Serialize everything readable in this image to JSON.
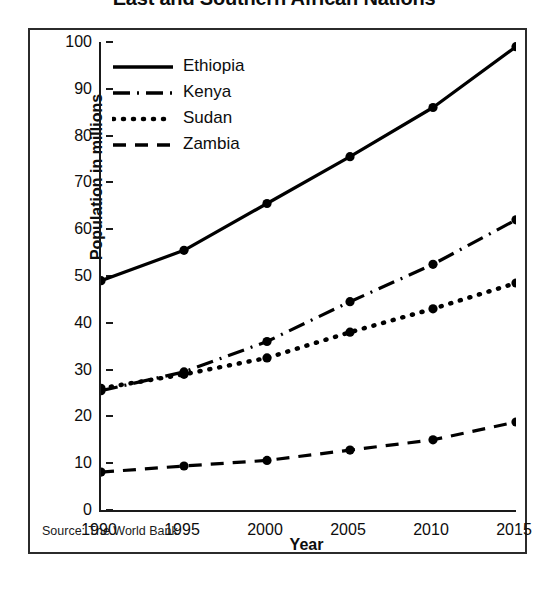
{
  "chart_data": {
    "type": "line",
    "title": "East and Southern African Nations",
    "subtitle": "",
    "xlabel": "Year",
    "ylabel": "Population in millions",
    "x": [
      1990,
      1995,
      2000,
      2005,
      2010,
      2015
    ],
    "categories": [
      "1990",
      "1995",
      "2000",
      "2005",
      "2010",
      "2015"
    ],
    "xlim": [
      1990,
      2015
    ],
    "ylim": [
      0,
      100
    ],
    "y_ticks": [
      0,
      10,
      20,
      30,
      40,
      50,
      60,
      70,
      80,
      90,
      100
    ],
    "y_tick_labels": [
      "0",
      "10",
      "20",
      "30",
      "40",
      "50",
      "60",
      "70",
      "80",
      "90",
      "100"
    ],
    "grid": false,
    "legend_position": "top-left-inside",
    "markers": "filled-circle",
    "series": [
      {
        "name": "Ethiopia",
        "style": "solid",
        "color": "#000000",
        "values": [
          49,
          55.5,
          65.5,
          75.5,
          86,
          99
        ]
      },
      {
        "name": "Kenya",
        "style": "dash-dot",
        "color": "#000000",
        "values": [
          25.5,
          29.5,
          36,
          44.5,
          52.5,
          62
        ]
      },
      {
        "name": "Sudan",
        "style": "dotted",
        "color": "#000000",
        "values": [
          26,
          29,
          32.5,
          38,
          43,
          48.5
        ]
      },
      {
        "name": "Zambia",
        "style": "dashed",
        "color": "#000000",
        "values": [
          8.1,
          9.4,
          10.6,
          12.8,
          15,
          18.8
        ]
      }
    ],
    "annotations": [
      "Source: The World Bank"
    ]
  },
  "source_note": "Source: The World Bank",
  "colors": {
    "ink": "#000000",
    "frame": "#2b2b2b",
    "axis": "#1a1a1a",
    "background": "#ffffff"
  }
}
